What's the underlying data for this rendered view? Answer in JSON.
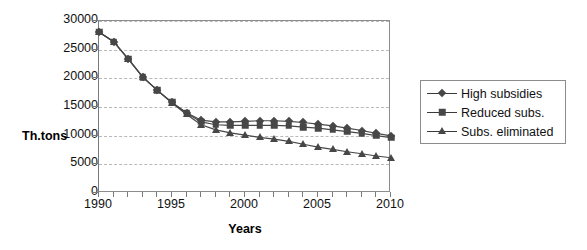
{
  "chart_data": {
    "type": "line",
    "title": "",
    "xlabel": "Years",
    "ylabel": "Th.tons",
    "xlim": [
      1990,
      2010
    ],
    "ylim": [
      0,
      30000
    ],
    "grid": true,
    "legend_position": "right",
    "x": [
      1990,
      1991,
      1992,
      1993,
      1994,
      1995,
      1996,
      1997,
      1998,
      1999,
      2000,
      2001,
      2002,
      2003,
      2004,
      2005,
      2006,
      2007,
      2008,
      2009,
      2010
    ],
    "xticks": [
      1990,
      1991,
      1992,
      1993,
      1994,
      1995,
      1996,
      1997,
      1998,
      1999,
      2000,
      2001,
      2002,
      2003,
      2004,
      2005,
      2006,
      2007,
      2008,
      2009,
      2010
    ],
    "xtick_labels_shown": [
      "1990",
      "1995",
      "2000",
      "2005",
      "2010"
    ],
    "yticks": [
      0,
      5000,
      10000,
      15000,
      20000,
      25000,
      30000
    ],
    "ytick_labels": [
      "0",
      "5000",
      "10000",
      "15000",
      "20000",
      "25000",
      "30000"
    ],
    "series": [
      {
        "name": "High subsidies",
        "marker": "diamond",
        "color": "#474747",
        "values": [
          28100,
          26400,
          23400,
          20200,
          17900,
          15800,
          14000,
          12700,
          12400,
          12400,
          12500,
          12600,
          12600,
          12500,
          12300,
          12000,
          11700,
          11300,
          10900,
          10400,
          9950
        ]
      },
      {
        "name": "Reduced subs.",
        "marker": "square",
        "color": "#474747",
        "values": [
          28100,
          26400,
          23400,
          20200,
          17900,
          15800,
          13900,
          12400,
          11900,
          11800,
          11800,
          11800,
          11800,
          11700,
          11500,
          11300,
          11000,
          10700,
          10400,
          10000,
          9650
        ]
      },
      {
        "name": "Subs. eliminated",
        "marker": "triangle",
        "color": "#474747",
        "values": [
          28100,
          26400,
          23400,
          20200,
          17900,
          15700,
          13700,
          11900,
          11000,
          10500,
          10100,
          9700,
          9400,
          9000,
          8500,
          8000,
          7600,
          7200,
          6850,
          6450,
          6150
        ]
      }
    ]
  },
  "legend": {
    "items": [
      {
        "label": "High subsidies",
        "marker": "diamond"
      },
      {
        "label": "Reduced subs.",
        "marker": "square"
      },
      {
        "label": "Subs. eliminated",
        "marker": "triangle"
      }
    ]
  },
  "axes": {
    "x_title": "Years",
    "y_title": "Th.tons"
  },
  "colors": {
    "series": "#474747",
    "grid": "#b9b9b9",
    "axis": "#7a7a7a",
    "frame": "#8c8c8c",
    "text": "#111111",
    "background": "#ffffff"
  }
}
